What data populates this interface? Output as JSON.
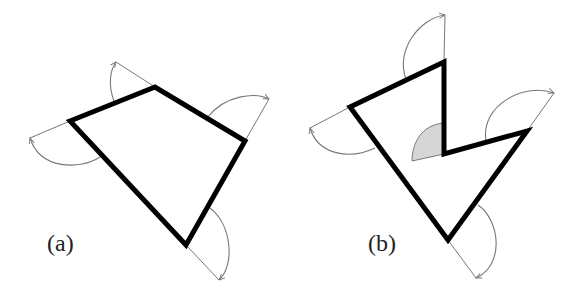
{
  "figure": {
    "panels": [
      {
        "label": "(a)",
        "description": "Convex quadrilateral with exterior angles marked at each vertex",
        "vertices": [
          [
            70,
            121
          ],
          [
            155,
            87
          ],
          [
            245,
            141
          ],
          [
            186,
            245
          ]
        ],
        "exterior_angles": 4
      },
      {
        "label": "(b)",
        "description": "Concave pentagon with exterior angles; reflex vertex has shaded negative exterior angle",
        "vertices": [
          [
            350,
            107
          ],
          [
            444,
            62
          ],
          [
            444,
            154
          ],
          [
            527,
            131
          ],
          [
            448,
            240
          ]
        ],
        "exterior_angles": 5,
        "shaded_vertex": [
          444,
          154
        ]
      }
    ],
    "colors": {
      "polygon_stroke": "#000000",
      "arc_stroke": "#777777",
      "shade_fill": "#d6d6d6"
    }
  }
}
